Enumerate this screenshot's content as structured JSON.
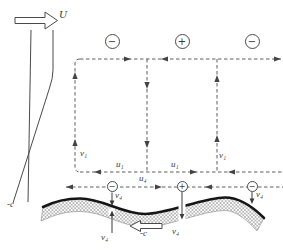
{
  "labels": {
    "wind": "U",
    "minus_c": "-c",
    "v1": "v₁",
    "u1": "u₁",
    "u4": "u₄",
    "v4": "v₄"
  },
  "charges": {
    "top": [
      "−",
      "+",
      "−"
    ],
    "surface": [
      "−",
      "+",
      "−"
    ]
  },
  "colors": {
    "line": "#4a4a4a",
    "dashed_line": "#5f5f5f",
    "surface_line": "#151515",
    "hatch": "#8a8a8a",
    "background": "#ffffff"
  }
}
